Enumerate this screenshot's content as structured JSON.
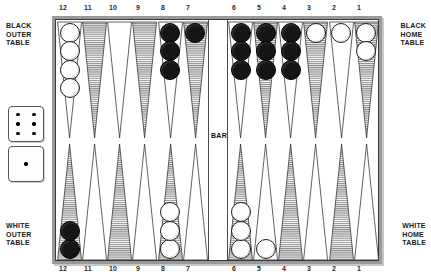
{
  "board": {
    "labels": {
      "black_outer": "BLACK\nOUTER\nTABLE",
      "black_home": "BLACK\nHOME\nTABLE",
      "white_outer": "WHITE\nOUTER\nTABLE",
      "white_home": "WHITE\nHOME\nTABLE",
      "bar": "BAR"
    },
    "colors": {
      "frame": "#9a9a9a",
      "line": "#3a3a3a",
      "shaded_point": "#8c8c8c",
      "plain_point": "#ffffff",
      "white_checker": "#fdfdfd",
      "black_checker": "#151515",
      "background": "#ffffff"
    },
    "point_numbers_top": [
      "12",
      "11",
      "10",
      "9",
      "8",
      "7",
      "6",
      "5",
      "4",
      "3",
      "2",
      "1"
    ],
    "point_numbers_bottom": [
      "12",
      "11",
      "10",
      "9",
      "8",
      "7",
      "6",
      "5",
      "4",
      "3",
      "2",
      "1"
    ],
    "top_points": [
      {
        "number": "12",
        "shaded": false,
        "checkers": 4,
        "color": "white"
      },
      {
        "number": "11",
        "shaded": true,
        "checkers": 0,
        "color": "none"
      },
      {
        "number": "10",
        "shaded": false,
        "checkers": 0,
        "color": "none"
      },
      {
        "number": "9",
        "shaded": true,
        "checkers": 0,
        "color": "none"
      },
      {
        "number": "8",
        "shaded": false,
        "checkers": 3,
        "color": "black"
      },
      {
        "number": "7",
        "shaded": true,
        "checkers": 1,
        "color": "black"
      },
      {
        "number": "6",
        "shaded": false,
        "checkers": 3,
        "color": "black"
      },
      {
        "number": "5",
        "shaded": true,
        "checkers": 3,
        "color": "black"
      },
      {
        "number": "4",
        "shaded": false,
        "checkers": 3,
        "color": "black"
      },
      {
        "number": "3",
        "shaded": true,
        "checkers": 1,
        "color": "white"
      },
      {
        "number": "2",
        "shaded": false,
        "checkers": 1,
        "color": "white"
      },
      {
        "number": "1",
        "shaded": true,
        "checkers": 2,
        "color": "white"
      }
    ],
    "bottom_points": [
      {
        "number": "12",
        "shaded": true,
        "checkers": 2,
        "color": "black"
      },
      {
        "number": "11",
        "shaded": false,
        "checkers": 0,
        "color": "none"
      },
      {
        "number": "10",
        "shaded": true,
        "checkers": 0,
        "color": "none"
      },
      {
        "number": "9",
        "shaded": false,
        "checkers": 0,
        "color": "none"
      },
      {
        "number": "8",
        "shaded": true,
        "checkers": 3,
        "color": "white"
      },
      {
        "number": "7",
        "shaded": false,
        "checkers": 0,
        "color": "none"
      },
      {
        "number": "6",
        "shaded": true,
        "checkers": 3,
        "color": "white"
      },
      {
        "number": "5",
        "shaded": false,
        "checkers": 1,
        "color": "white"
      },
      {
        "number": "4",
        "shaded": true,
        "checkers": 0,
        "color": "none"
      },
      {
        "number": "3",
        "shaded": false,
        "checkers": 0,
        "color": "none"
      },
      {
        "number": "2",
        "shaded": true,
        "checkers": 0,
        "color": "none"
      },
      {
        "number": "1",
        "shaded": false,
        "checkers": 0,
        "color": "none"
      }
    ]
  },
  "dice": [
    {
      "name": "die-left",
      "value": 6
    },
    {
      "name": "die-right",
      "value": 1
    }
  ]
}
